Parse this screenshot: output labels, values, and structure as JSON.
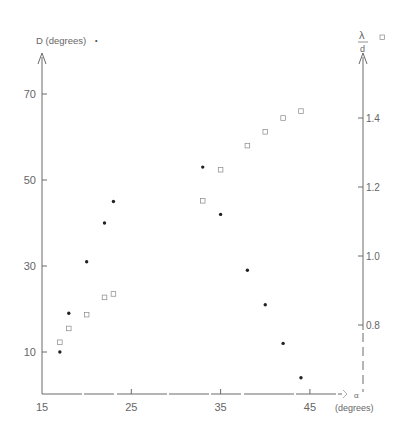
{
  "chart_data": {
    "type": "scatter",
    "title": "",
    "xlabel": "α (degrees)",
    "ylabel": "D (degrees)",
    "ylabel_right": "λ/d",
    "xlim": [
      15,
      49
    ],
    "ylim": [
      0,
      80
    ],
    "ylim_right": [
      0.5,
      1.6
    ],
    "x_ticks": [
      15,
      25,
      35,
      45
    ],
    "y_ticks": [
      10,
      30,
      50,
      70
    ],
    "y_ticks_right": [
      "0.8",
      "1.0",
      "1.2",
      "1.4"
    ],
    "grid": false,
    "legend": [
      {
        "name": "D (degrees)",
        "marker": "filled-dot",
        "axis": "left"
      },
      {
        "name": "λ/d",
        "marker": "open-square",
        "axis": "right"
      }
    ],
    "series": [
      {
        "name": "D (degrees)",
        "marker": "dot",
        "axis": "left",
        "x": [
          17,
          18,
          20,
          22,
          23,
          33,
          35,
          38,
          40,
          42,
          44
        ],
        "y": [
          10,
          19,
          31,
          40,
          45,
          53,
          42,
          29,
          21,
          12,
          4
        ]
      },
      {
        "name": "λ/d",
        "marker": "square",
        "axis": "right",
        "x": [
          17,
          18,
          20,
          22,
          23,
          33,
          35,
          38,
          40,
          42,
          44
        ],
        "y": [
          0.75,
          0.79,
          0.83,
          0.88,
          0.89,
          1.16,
          1.25,
          1.32,
          1.36,
          1.4,
          1.42
        ]
      }
    ]
  },
  "labels": {
    "left_axis_title": "D (degrees)",
    "right_axis_num": "λ",
    "right_axis_den": "d",
    "x_axis_symbol": "α",
    "x_axis_unit": "(degrees)"
  }
}
